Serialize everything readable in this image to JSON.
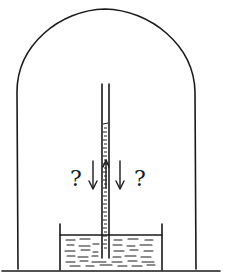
{
  "diagram": {
    "labels": {
      "left_question": "?",
      "right_question": "?"
    },
    "elements": {
      "bell_jar": "bell-jar",
      "tube": "barometer-tube",
      "dish": "liquid-dish",
      "arrows": [
        "down-arrow-left",
        "up-arrow-tube",
        "down-arrow-right"
      ]
    },
    "colors": {
      "stroke": "#1a1a1a",
      "background": "#ffffff"
    }
  }
}
